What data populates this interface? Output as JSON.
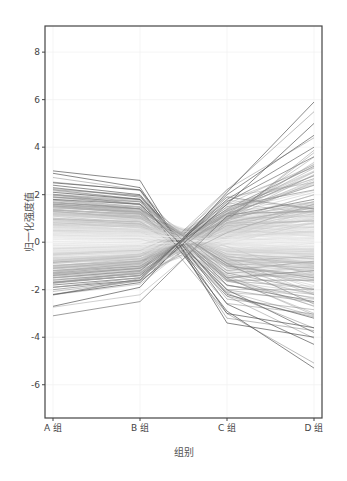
{
  "chart_data": {
    "type": "line",
    "title": "",
    "xlabel": "组别",
    "ylabel": "归一化强度值",
    "categories": [
      "A 组",
      "B 组",
      "C 组",
      "D 组"
    ],
    "yticks": [
      -6,
      -4,
      -2,
      0,
      2,
      4,
      6,
      8
    ],
    "ylim": [
      -7.4,
      9.1
    ],
    "grid": true,
    "legend": "none",
    "color_rule": "line grayscale darkens with magnitude of value; near 0 is white",
    "series": [
      {
        "name": "profile-1",
        "values": [
          3.0,
          2.6,
          -3.4,
          -4.0
        ]
      },
      {
        "name": "profile-2",
        "values": [
          2.9,
          2.3,
          -3.0,
          -3.6
        ]
      },
      {
        "name": "profile-3",
        "values": [
          2.5,
          2.2,
          -2.6,
          -4.3
        ]
      },
      {
        "name": "profile-4",
        "values": [
          2.4,
          2.0,
          -2.2,
          -3.2
        ]
      },
      {
        "name": "profile-5",
        "values": [
          2.3,
          1.9,
          -1.8,
          -2.5
        ]
      },
      {
        "name": "profile-6",
        "values": [
          2.2,
          1.8,
          -1.5,
          -1.2
        ]
      },
      {
        "name": "profile-7",
        "values": [
          2.1,
          1.8,
          -2.9,
          -5.3
        ]
      },
      {
        "name": "profile-8",
        "values": [
          2.0,
          1.7,
          -1.2,
          -0.8
        ]
      },
      {
        "name": "profile-9",
        "values": [
          1.9,
          1.6,
          -1.0,
          -1.5
        ]
      },
      {
        "name": "profile-10",
        "values": [
          1.8,
          1.5,
          -0.8,
          -0.6
        ]
      },
      {
        "name": "profile-11",
        "values": [
          1.7,
          1.4,
          -1.3,
          -2.0
        ]
      },
      {
        "name": "profile-12",
        "values": [
          1.6,
          1.3,
          -0.6,
          -0.9
        ]
      },
      {
        "name": "profile-13",
        "values": [
          1.5,
          1.2,
          -0.9,
          -1.1
        ]
      },
      {
        "name": "profile-14",
        "values": [
          1.4,
          1.1,
          -0.5,
          -0.7
        ]
      },
      {
        "name": "profile-15",
        "values": [
          1.3,
          1.0,
          -0.7,
          -1.3
        ]
      },
      {
        "name": "profile-16",
        "values": [
          1.2,
          0.9,
          -0.4,
          -0.5
        ]
      },
      {
        "name": "profile-17",
        "values": [
          1.1,
          0.8,
          -0.6,
          -1.0
        ]
      },
      {
        "name": "profile-18",
        "values": [
          1.0,
          0.7,
          -0.3,
          -0.4
        ]
      },
      {
        "name": "profile-19",
        "values": [
          0.9,
          0.6,
          -0.2,
          -0.6
        ]
      },
      {
        "name": "profile-20",
        "values": [
          0.8,
          0.5,
          -0.3,
          -0.3
        ]
      },
      {
        "name": "profile-21",
        "values": [
          0.6,
          0.4,
          -0.1,
          -0.2
        ]
      },
      {
        "name": "profile-22",
        "values": [
          0.4,
          0.3,
          0.1,
          0.2
        ]
      },
      {
        "name": "profile-23",
        "values": [
          0.2,
          0.2,
          0.0,
          0.1
        ]
      },
      {
        "name": "profile-24",
        "values": [
          -0.2,
          -0.1,
          0.1,
          0.0
        ]
      },
      {
        "name": "profile-25",
        "values": [
          -0.4,
          -0.3,
          0.2,
          0.3
        ]
      },
      {
        "name": "profile-26",
        "values": [
          -0.6,
          -0.4,
          0.3,
          0.4
        ]
      },
      {
        "name": "profile-27",
        "values": [
          -0.8,
          -0.5,
          0.5,
          0.8
        ]
      },
      {
        "name": "profile-28",
        "values": [
          -0.9,
          -0.6,
          0.6,
          1.2
        ]
      },
      {
        "name": "profile-29",
        "values": [
          -1.0,
          -0.7,
          0.8,
          1.5
        ]
      },
      {
        "name": "profile-30",
        "values": [
          -1.1,
          -0.8,
          0.9,
          2.0
        ]
      },
      {
        "name": "profile-31",
        "values": [
          -1.2,
          -0.9,
          1.0,
          1.7
        ]
      },
      {
        "name": "profile-32",
        "values": [
          -1.3,
          -1.0,
          1.2,
          2.4
        ]
      },
      {
        "name": "profile-33",
        "values": [
          -1.4,
          -1.1,
          1.3,
          2.8
        ]
      },
      {
        "name": "profile-34",
        "values": [
          -1.5,
          -1.2,
          1.4,
          3.2
        ]
      },
      {
        "name": "profile-35",
        "values": [
          -1.6,
          -1.3,
          1.5,
          2.2
        ]
      },
      {
        "name": "profile-36",
        "values": [
          -1.7,
          -1.4,
          1.7,
          3.6
        ]
      },
      {
        "name": "profile-37",
        "values": [
          -1.8,
          -1.5,
          1.8,
          4.0
        ]
      },
      {
        "name": "profile-38",
        "values": [
          -1.9,
          -1.6,
          2.0,
          4.5
        ]
      },
      {
        "name": "profile-39",
        "values": [
          -2.0,
          -1.6,
          1.9,
          1.4
        ]
      },
      {
        "name": "profile-40",
        "values": [
          -2.2,
          -1.7,
          1.6,
          5.0
        ]
      },
      {
        "name": "profile-41",
        "values": [
          -2.7,
          -1.9,
          2.1,
          5.9
        ]
      },
      {
        "name": "profile-42",
        "values": [
          -3.1,
          -2.5,
          1.1,
          1.8
        ]
      },
      {
        "name": "profile-43",
        "values": [
          1.9,
          1.7,
          -1.6,
          -1.6
        ]
      },
      {
        "name": "profile-44",
        "values": [
          1.8,
          1.6,
          -2.0,
          -3.8
        ]
      },
      {
        "name": "profile-45",
        "values": [
          -1.9,
          -1.5,
          1.2,
          1.3
        ]
      },
      {
        "name": "profile-46",
        "values": [
          -1.7,
          -1.4,
          0.4,
          1.6
        ]
      },
      {
        "name": "profile-47",
        "values": [
          1.6,
          1.4,
          -0.9,
          -2.6
        ]
      },
      {
        "name": "profile-48",
        "values": [
          -1.5,
          -1.3,
          0.7,
          0.9
        ]
      }
    ]
  }
}
